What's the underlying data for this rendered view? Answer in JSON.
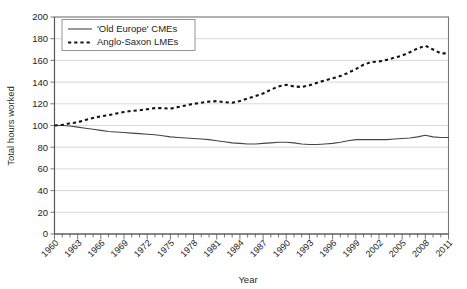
{
  "chart_data": {
    "type": "line",
    "title": "",
    "xlabel": "Year",
    "ylabel": "Total hours worked",
    "xlim": [
      1960,
      2011
    ],
    "ylim": [
      0,
      200
    ],
    "ytick_step": 20,
    "xtick_step": 1,
    "xtick_label_step": 3,
    "grid": true,
    "legend_position": "top-left",
    "yticks": [
      0,
      20,
      40,
      60,
      80,
      100,
      120,
      140,
      160,
      180,
      200
    ],
    "ytick_labels": [
      "0",
      "20",
      "40",
      "60",
      "80",
      "100",
      "120",
      "140",
      "160",
      "180",
      "200"
    ],
    "xtick_labels": [
      "1960",
      "1963",
      "1966",
      "1969",
      "1972",
      "1975",
      "1978",
      "1981",
      "1984",
      "1987",
      "1990",
      "1993",
      "1996",
      "1999",
      "2002",
      "2005",
      "2008",
      "2011"
    ],
    "x": [
      1960,
      1961,
      1962,
      1963,
      1964,
      1965,
      1966,
      1967,
      1968,
      1969,
      1970,
      1971,
      1972,
      1973,
      1974,
      1975,
      1976,
      1977,
      1978,
      1979,
      1980,
      1981,
      1982,
      1983,
      1984,
      1985,
      1986,
      1987,
      1988,
      1989,
      1990,
      1991,
      1992,
      1993,
      1994,
      1995,
      1996,
      1997,
      1998,
      1999,
      2000,
      2001,
      2002,
      2003,
      2004,
      2005,
      2006,
      2007,
      2008,
      2009,
      2010,
      2011
    ],
    "series": [
      {
        "name": "'Old Europe' CMEs",
        "style": "solid",
        "color": "#454545",
        "values": [
          100,
          100,
          99.5,
          98.5,
          97.5,
          96.5,
          95.5,
          94.5,
          94,
          93.5,
          93,
          92.5,
          92,
          91.5,
          90.5,
          89.5,
          89,
          88.5,
          88,
          87.5,
          87,
          86,
          85,
          84,
          83.5,
          83,
          83,
          83.5,
          84,
          84.5,
          84.5,
          84,
          83,
          82.5,
          82.5,
          83,
          83.5,
          84.5,
          86,
          87,
          87,
          87,
          87,
          87,
          87.5,
          88,
          88.5,
          89.5,
          91,
          89.5,
          89,
          89
        ]
      },
      {
        "name": "Anglo-Saxon LMEs",
        "style": "dotted",
        "color": "#141414",
        "values": [
          100,
          100.5,
          102,
          103,
          105,
          107,
          108.5,
          109.5,
          111,
          112.5,
          113.5,
          114,
          115,
          116,
          116,
          115.5,
          117,
          118.5,
          120,
          121,
          122,
          122.5,
          121.5,
          121,
          122.5,
          125,
          127,
          129.5,
          133,
          136,
          137.5,
          136,
          135.5,
          137,
          139.5,
          141.5,
          143.5,
          145.5,
          148.5,
          152,
          156,
          158.5,
          159,
          160.5,
          162.5,
          164.5,
          167.5,
          171,
          173.5,
          170,
          166.5,
          166.5
        ]
      }
    ]
  },
  "legend": {
    "entries": [
      {
        "label": "'Old Europe' CMEs",
        "style": "solid"
      },
      {
        "label": "Anglo-Saxon LMEs",
        "style": "dotted"
      }
    ]
  }
}
